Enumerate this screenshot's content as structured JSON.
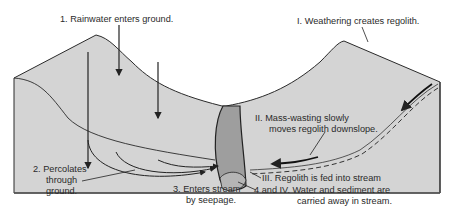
{
  "diagram": {
    "colors": {
      "terrain": "#d4d4d4",
      "terrain_front": "#cfcfcf",
      "stream_channel": "#9e9e9e",
      "stream_bottom": "#b5b5b5",
      "line": "#222222",
      "background": "#ffffff"
    },
    "labels": {
      "step1": "1.  Rainwater enters ground.",
      "step2_line1": "2.  Percolates",
      "step2_line2": "through",
      "step2_line3": "ground.",
      "step3_line1": "3.  Enters stream",
      "step3_line2": "by seepage.",
      "stepI": "I.  Weathering creates regolith.",
      "stepII_line1": "II.  Mass-wasting slowly",
      "stepII_line2": "moves regolith downslope.",
      "stepIII": "III.  Regolith is fed into stream",
      "step4_line1": "4 and IV.  Water and sediment are",
      "step4_line2": "carried away in stream."
    }
  }
}
